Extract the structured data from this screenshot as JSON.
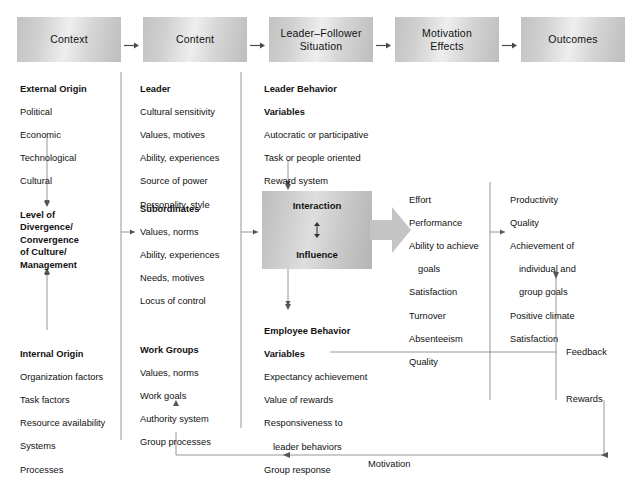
{
  "figure": {
    "title": "",
    "top_partial_text": ""
  },
  "header": {
    "boxes": [
      {
        "id": "context",
        "label": "Context"
      },
      {
        "id": "content",
        "label": "Content"
      },
      {
        "id": "leader-follower-situation",
        "line1": "Leader–Follower",
        "line2": "Situation"
      },
      {
        "id": "motivation-effects",
        "line1": "Motivation",
        "line2": "Effects"
      },
      {
        "id": "outcomes",
        "label": "Outcomes"
      }
    ],
    "arrow_glyph": "→"
  },
  "columns": {
    "context": {
      "external_origin": {
        "heading": "External Origin",
        "items": [
          "Political",
          "Economic",
          "Technological",
          "Cultural"
        ]
      },
      "level_of_divergence": {
        "lines": [
          "Level of",
          "Divergence/",
          "Convergence",
          "of Culture/",
          "Management"
        ]
      },
      "internal_origin": {
        "heading": "Internal Origin",
        "items": [
          "Organization factors",
          "Task factors",
          "Resource availability",
          "Systems",
          "Processes"
        ]
      }
    },
    "content": {
      "leader": {
        "heading": "Leader",
        "items": [
          "Cultural sensitivity",
          "Values, motives",
          "Ability, experiences",
          "Source of power",
          "Personality, style"
        ]
      },
      "subordinates": {
        "heading": "Subordinates",
        "items": [
          "Values, norms",
          "Ability, experiences",
          "Needs, motives",
          "Locus of control"
        ]
      },
      "work_groups": {
        "heading": "Work Groups",
        "items": [
          "Values, norms",
          "Work goals",
          "Authority system",
          "Group processes"
        ]
      }
    },
    "leader_follower_situation": {
      "leader_behavior_variables": {
        "heading_line1": "Leader Behavior",
        "heading_line2": "Variables",
        "items": [
          "Autocratic or participative",
          "Task or people oriented",
          "Reward system",
          "Transformational"
        ]
      },
      "interaction_box": {
        "top_label": "Interaction",
        "bottom_label": "Influence"
      },
      "employee_behavior_variables": {
        "heading_line1": "Employee Behavior",
        "heading_line2": "Variables",
        "items": [
          {
            "text": "Expectancy achievement",
            "indent": false
          },
          {
            "text": "Value of rewards",
            "indent": false
          },
          {
            "text": "Responsiveness to",
            "indent": false
          },
          {
            "text": "leader behaviors",
            "indent": true
          },
          {
            "text": "Group response",
            "indent": false
          }
        ]
      }
    },
    "motivation_effects": {
      "items": [
        {
          "text": "Effort",
          "indent": false
        },
        {
          "text": "Performance",
          "indent": false
        },
        {
          "text": "Ability to achieve",
          "indent": false
        },
        {
          "text": "goals",
          "indent": true
        },
        {
          "text": "Satisfaction",
          "indent": false
        },
        {
          "text": "Turnover",
          "indent": false
        },
        {
          "text": "Absenteeism",
          "indent": false
        },
        {
          "text": "Quality",
          "indent": false
        }
      ]
    },
    "outcomes": {
      "items": [
        {
          "text": "Productivity",
          "indent": false
        },
        {
          "text": "Quality",
          "indent": false
        },
        {
          "text": "Achievement of",
          "indent": false
        },
        {
          "text": "individual and",
          "indent": true
        },
        {
          "text": "group goals",
          "indent": true
        },
        {
          "text": "Positive climate",
          "indent": false
        },
        {
          "text": "Satisfaction",
          "indent": false
        }
      ]
    }
  },
  "feedback_loops": {
    "feedback_label": "Feedback",
    "rewards_label": "Rewards",
    "motivation_label": "Motivation"
  },
  "colors": {
    "box_gradient_light": "#eeeeee",
    "box_gradient_dark": "#bdbdbd",
    "line": "#6d6d6d",
    "text": "#111111"
  }
}
